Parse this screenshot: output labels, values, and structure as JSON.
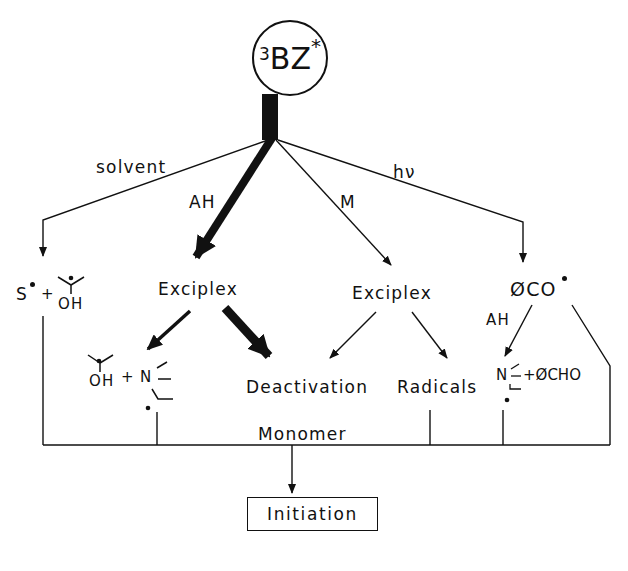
{
  "diagram": {
    "root": {
      "prefix": "3",
      "label": "BZ",
      "suffix": "*"
    },
    "branches": [
      {
        "id": "solvent",
        "label": "solvent",
        "weight": "thin"
      },
      {
        "id": "ah",
        "label": "AH",
        "weight": "thick"
      },
      {
        "id": "m",
        "label": "M",
        "weight": "thin"
      },
      {
        "id": "hv",
        "label": "hν",
        "weight": "thin"
      }
    ],
    "nodes": {
      "solvent_products": {
        "left": "S",
        "plus": "+",
        "ketyl_oh": "OH"
      },
      "exciplex_left": "Exciplex",
      "exciplex_right": "Exciplex",
      "benzoyl": {
        "phi": "Ø",
        "co": "CO"
      },
      "ketyl_amine": {
        "oh": "OH",
        "plus": "+",
        "n": "N"
      },
      "deactivation": "Deactivation",
      "radicals": "Radicals",
      "benzoyl_ah_label": "AH",
      "amine_benzaldehyde": {
        "n": "N",
        "rest": "+ØCHO"
      },
      "monomer": "Monomer",
      "initiation": "Initiation"
    }
  }
}
